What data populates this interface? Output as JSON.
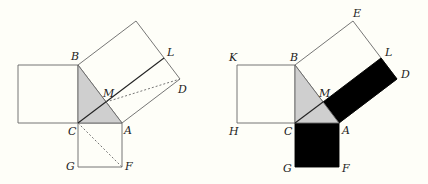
{
  "figure": {
    "colors": {
      "background": "#fefef8",
      "line": "#555555",
      "triangle_fill": "#cfcfcf",
      "filled_black": "#000000"
    },
    "left": {
      "labels": {
        "B": "B",
        "L": "L",
        "M": "M",
        "D": "D",
        "C": "C",
        "A": "A",
        "G": "G",
        "F": "F"
      }
    },
    "right": {
      "labels": {
        "E": "E",
        "K": "K",
        "B": "B",
        "L": "L",
        "D": "D",
        "M": "M",
        "H": "H",
        "C": "C",
        "A": "A",
        "G": "G",
        "F": "F"
      }
    }
  }
}
